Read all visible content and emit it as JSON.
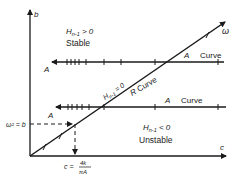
{
  "diagram": {
    "axes": {
      "y_label": "b",
      "x_label": "c",
      "diag_label": "ω"
    },
    "regions": {
      "upper": {
        "condition": "H",
        "sub": "n-1",
        "rel": " > 0",
        "label": "Stable"
      },
      "lower": {
        "condition": "H",
        "sub": "n-1",
        "rel": " < 0",
        "label": "Unstable"
      },
      "boundary": {
        "condition": "H",
        "sub": "n-1",
        "rel": " = 0"
      }
    },
    "curves": {
      "upper_a": {
        "start_label": "A",
        "end_label": "A",
        "name": "Curve"
      },
      "lower_a": {
        "start_label": "A",
        "end_label": "A",
        "name": "Curve"
      },
      "r_curve": {
        "label": "R",
        "name": "Curve"
      }
    },
    "annotations": {
      "omega_sq": "ω² = b",
      "c_formula_left": "c =",
      "c_formula_num": "4k",
      "c_formula_den": "πA"
    },
    "colors": {
      "line": "#1a1a1a",
      "background": "#ffffff"
    }
  }
}
